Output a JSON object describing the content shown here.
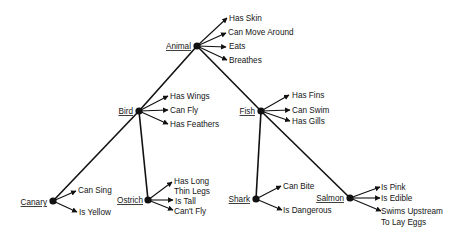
{
  "nodes": [
    {
      "id": "animal",
      "label": "Animal",
      "properties": [
        "Has Skin",
        "Can Move Around",
        "Eats",
        "Breathes"
      ]
    },
    {
      "id": "bird",
      "label": "Bird",
      "properties": [
        "Has Wings",
        "Can Fly",
        "Has Feathers"
      ]
    },
    {
      "id": "fish",
      "label": "Fish",
      "properties": [
        "Has Fins",
        "Can Swim",
        "Has Gills"
      ]
    },
    {
      "id": "canary",
      "label": "Canary",
      "properties": [
        "Can Sing",
        "Is Yellow"
      ]
    },
    {
      "id": "ostrich",
      "label": "Ostrich",
      "properties": [
        "Has Long Thin Legs",
        "Is Tall",
        "Can't Fly"
      ]
    },
    {
      "id": "shark",
      "label": "Shark",
      "properties": [
        "Can Bite",
        "Is Dangerous"
      ]
    },
    {
      "id": "salmon",
      "label": "Salmon",
      "properties": [
        "Is Pink",
        "Is Edible",
        "Swims Upstream To Lay Eggs"
      ]
    }
  ],
  "edges": [
    {
      "from": "animal",
      "to": "bird"
    },
    {
      "from": "animal",
      "to": "fish"
    },
    {
      "from": "bird",
      "to": "canary"
    },
    {
      "from": "bird",
      "to": "ostrich"
    },
    {
      "from": "fish",
      "to": "shark"
    },
    {
      "from": "fish",
      "to": "salmon"
    }
  ],
  "labels": {
    "animal": "Animal",
    "bird": "Bird",
    "fish": "Fish",
    "canary": "Canary",
    "ostrich": "Ostrich",
    "shark": "Shark",
    "salmon": "Salmon",
    "animal_props": [
      "Has Skin",
      "Can Move Around",
      "Eats",
      "Breathes"
    ],
    "bird_props": [
      "Has Wings",
      "Can Fly",
      "Has Feathers"
    ],
    "fish_props": [
      "Has Fins",
      "Can Swim",
      "Has Gills"
    ],
    "canary_props": [
      "Can Sing",
      "Is Yellow"
    ],
    "ostrich_props": [
      "Has Long",
      "Thin Legs",
      "Is Tall",
      "Can't Fly"
    ],
    "shark_props": [
      "Can Bite",
      "Is Dangerous"
    ],
    "salmon_props": [
      "Is Pink",
      "Is Edible",
      "Swims Upstream",
      "To Lay Eggs"
    ]
  }
}
